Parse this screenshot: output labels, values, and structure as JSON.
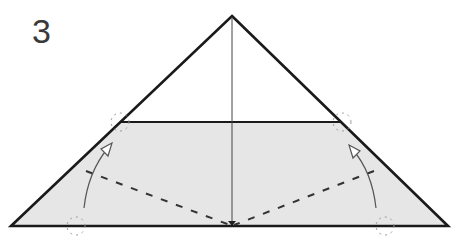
{
  "diagram": {
    "step_number": "3",
    "colors": {
      "outline": "#1a1a1a",
      "fill": "#e6e6e6",
      "center_line": "#444444",
      "valley_fold": "#333333",
      "arrow": "#555555",
      "reference_marks": "#9a9a9a"
    },
    "elements": [
      "outer-triangle",
      "shaded-flap",
      "center-crease",
      "valley-fold-left",
      "valley-fold-right",
      "fold-arrow-left",
      "fold-arrow-right",
      "reference-circle-marks"
    ]
  }
}
